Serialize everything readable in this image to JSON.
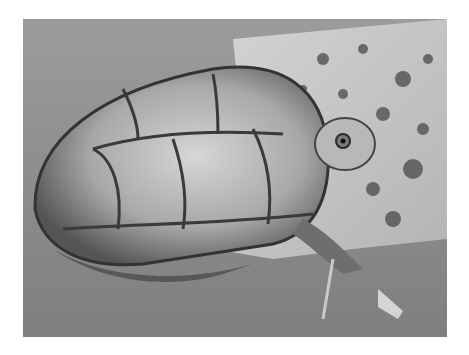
{
  "image": {
    "description": "Grayscale photograph of a mud turtle resting on a mottled log in water",
    "alt": "Turtle on a log",
    "colors": {
      "background": "#ffffff",
      "water": "#8f8f8f",
      "log": "#c8c8c8",
      "shell_light": "#bdbdbd",
      "shell_dark": "#3a3a3a"
    }
  }
}
